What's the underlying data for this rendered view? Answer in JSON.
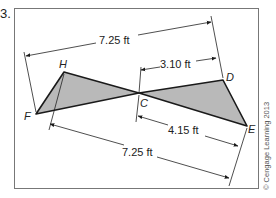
{
  "problem": {
    "number": "3."
  },
  "figure": {
    "points": {
      "H": "H",
      "F": "F",
      "C": "C",
      "D": "D",
      "E": "E"
    },
    "dimensions": {
      "top_overall": "7.25 ft",
      "top_partial": "3.10 ft",
      "bottom_partial": "4.15 ft",
      "bottom_overall": "7.25 ft"
    },
    "colors": {
      "triangle_fill": "#b9b9b9",
      "line": "#1a1a1a",
      "frame": "#777777"
    }
  },
  "credit": "© Cengage Learning 2013"
}
